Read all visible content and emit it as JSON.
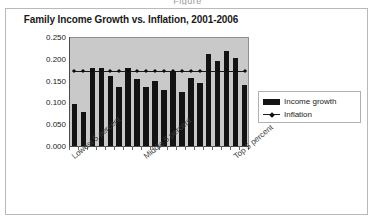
{
  "figure_caption": "Figure",
  "chart": {
    "title": "Family Income Growth vs. Inflation, 2001-2006",
    "legend": {
      "income_label": "Income growth",
      "inflation_label": "Inflation"
    },
    "y_ticks": [
      "0.000",
      "0.050",
      "0.100",
      "0.150",
      "0.200",
      "0.250"
    ],
    "category_labels": [
      "Lowest 5 percent",
      "Middle 5 percent",
      "Top 5 percent"
    ],
    "colors": {
      "bar": "#131313",
      "line": "#1a1a1a",
      "plot_background": "#c9c9c9",
      "frame": "#b9b9b9"
    }
  },
  "chart_data": {
    "type": "bar",
    "title": "Family Income Growth vs. Inflation, 2001-2006",
    "xlabel": "",
    "ylabel": "",
    "ylim": [
      0.0,
      0.25
    ],
    "ytick_values": [
      0.0,
      0.05,
      0.1,
      0.15,
      0.2,
      0.25
    ],
    "grid": false,
    "legend_position": "right",
    "categories": [
      "Lowest 5 percent",
      "2",
      "3",
      "4",
      "5",
      "6",
      "7",
      "8",
      "Middle 5 percent",
      "10",
      "11",
      "12",
      "13",
      "14",
      "15",
      "16",
      "17",
      "18",
      "Top 5 percent",
      "20"
    ],
    "series": [
      {
        "name": "Income growth",
        "type": "bar",
        "values": [
          0.097,
          0.077,
          0.178,
          0.18,
          0.161,
          0.135,
          0.178,
          0.153,
          0.135,
          0.148,
          0.129,
          0.171,
          0.125,
          0.155,
          0.145,
          0.21,
          0.196,
          0.218,
          0.201,
          0.139
        ]
      },
      {
        "name": "Inflation",
        "type": "line",
        "marker": "diamond",
        "values": [
          0.172,
          0.172,
          0.172,
          0.172,
          0.172,
          0.172,
          0.172,
          0.172,
          0.172,
          0.172,
          0.172,
          0.172,
          0.172,
          0.172,
          0.172,
          0.172,
          0.172,
          0.172,
          0.172,
          0.172
        ]
      }
    ]
  }
}
